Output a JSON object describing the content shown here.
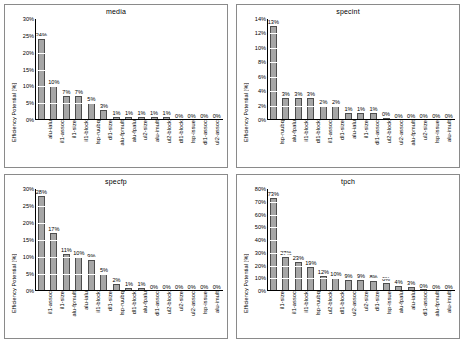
{
  "axis": {
    "ylabel": "Efficiency Potential [%]"
  },
  "chart_data": [
    {
      "type": "bar",
      "title": "media",
      "xlabel": "",
      "ylabel": "Efficiency Potential [%]",
      "ylim": [
        0,
        30
      ],
      "ytick_step": 5,
      "yticks": [
        "0%",
        "5%",
        "10%",
        "15%",
        "20%",
        "25%",
        "30%"
      ],
      "grid": false,
      "legend": "none",
      "categories": [
        "alu-ialu",
        "il1-assoc",
        "il1-size",
        "il1-block",
        "lsp-ruubq",
        "dl1-size",
        "alu-fpmult",
        "alu-fpalu",
        "ul2-size",
        "alu-imult",
        "ul2-block",
        "dl1-block",
        "lsp-issue",
        "dl1-assoc",
        "ul2-assoc"
      ],
      "values": [
        24,
        10,
        7,
        7,
        5,
        3,
        1,
        1,
        1,
        1,
        1,
        0,
        0,
        0,
        0
      ],
      "labels": [
        "24%",
        "10%",
        "7%",
        "7%",
        "5%",
        "3%",
        "1%",
        "1%",
        "1%",
        "1%",
        "1%",
        "0%",
        "0%",
        "0%",
        "0%"
      ]
    },
    {
      "type": "bar",
      "title": "specint",
      "xlabel": "",
      "ylabel": "Efficiency Potential [%]",
      "ylim": [
        0,
        14
      ],
      "ytick_step": 2,
      "yticks": [
        "0%",
        "2%",
        "4%",
        "6%",
        "8%",
        "10%",
        "12%",
        "14%"
      ],
      "grid": false,
      "legend": "none",
      "categories": [
        "lsp-ruubq",
        "alu-fpalu",
        "il1-block",
        "dl1-block",
        "il1-assoc",
        "dl1-size",
        "alu-ialu",
        "il1-size",
        "dl1-assoc",
        "ul2-block",
        "ul2-assoc",
        "alu-fpmult",
        "ul2-size",
        "lsp-issue",
        "alu-imult"
      ],
      "values": [
        13,
        3,
        3,
        3,
        2,
        2,
        1,
        1,
        1,
        0.3,
        0,
        0,
        0,
        0,
        0
      ],
      "labels": [
        "13%",
        "3%",
        "3%",
        "3%",
        "2%",
        "2%",
        "1%",
        "1%",
        "1%",
        "0%",
        "0%",
        "0%",
        "0%",
        "0%",
        "0%"
      ]
    },
    {
      "type": "bar",
      "title": "specfp",
      "xlabel": "",
      "ylabel": "Efficiency Potential [%]",
      "ylim": [
        0,
        30
      ],
      "ytick_step": 5,
      "yticks": [
        "0%",
        "5%",
        "10%",
        "15%",
        "20%",
        "25%",
        "30%"
      ],
      "grid": false,
      "legend": "none",
      "categories": [
        "il1-assoc",
        "il1-size",
        "alu-fpmult",
        "alu-ialu",
        "il1-block",
        "dl1-size",
        "lsp-ruubq",
        "dl1-block",
        "alu-fpalu",
        "dl1-assoc",
        "ul2-block",
        "ul2-size",
        "ul2-assoc",
        "lsp-issue",
        "alu-imult"
      ],
      "values": [
        28,
        17,
        11,
        10,
        9,
        5,
        2,
        1,
        1,
        0,
        0,
        0,
        0,
        0,
        0
      ],
      "labels": [
        "28%",
        "17%",
        "11%",
        "10%",
        "9%",
        "5%",
        "2%",
        "1%",
        "1%",
        "0%",
        "0%",
        "0%",
        "0%",
        "0%",
        "0%"
      ]
    },
    {
      "type": "bar",
      "title": "tpch",
      "xlabel": "",
      "ylabel": "Efficiency Potential [%]",
      "ylim": [
        0,
        80
      ],
      "ytick_step": 10,
      "yticks": [
        "0%",
        "10%",
        "20%",
        "30%",
        "40%",
        "50%",
        "60%",
        "70%",
        "80%"
      ],
      "grid": false,
      "legend": "none",
      "categories": [
        "il1-size",
        "il1-assoc",
        "il1-block",
        "lsp-ruubq",
        "ul2-block",
        "dl1-block",
        "ul2-assoc",
        "ul2-size",
        "dl1-size",
        "lsp-issue",
        "alu-fpalu",
        "alu-ialu",
        "dl1-assoc",
        "alu-fpmult",
        "alu-imult"
      ],
      "values": [
        73,
        27,
        23,
        19,
        12,
        10,
        9,
        9,
        8,
        6,
        4,
        3,
        0.5,
        0,
        0
      ],
      "labels": [
        "73%",
        "27%",
        "23%",
        "19%",
        "12%",
        "10%",
        "9%",
        "9%",
        "8%",
        "6%",
        "4%",
        "3%",
        "0%",
        "0%",
        "0%"
      ]
    }
  ]
}
